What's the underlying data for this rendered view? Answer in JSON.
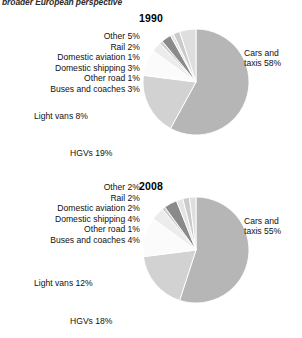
{
  "page": {
    "header": "broader European perspective"
  },
  "chart_data": [
    {
      "type": "pie",
      "title": "1990",
      "categories": [
        "Cars and taxis",
        "HGVs",
        "Light vans",
        "Buses and coaches",
        "Other road",
        "Domestic shipping",
        "Domestic aviation",
        "Rail",
        "Other"
      ],
      "values": [
        58,
        19,
        8,
        3,
        1,
        3,
        1,
        2,
        5
      ],
      "unit": "%",
      "labels": [
        "Cars and taxis 58%",
        "HGVs 19%",
        "Light vans 8%",
        "Buses and  coaches 3%",
        "Other road 1%",
        "Domestic shipping 3%",
        "Domestic aviation 1%",
        "Rail 2%",
        "Other 5%"
      ],
      "slice_colors": [
        "#b6b6b6",
        "#d2d2d2",
        "#fbfbfb",
        "#ececec",
        "#cfcfcf",
        "#8a8a8a",
        "#e4e4e4",
        "#cacaca",
        "#dedede"
      ],
      "start_angle": 0,
      "direction": "clockwise",
      "xlabel": "",
      "ylabel": "",
      "legend": "none",
      "grid": false
    },
    {
      "type": "pie",
      "title": "2008",
      "categories": [
        "Cars and taxis",
        "HGVs",
        "Light vans",
        "Buses and coaches",
        "Other road",
        "Domestic shipping",
        "Domestic aviation",
        "Rail",
        "Other"
      ],
      "values": [
        55,
        18,
        12,
        4,
        1,
        4,
        2,
        2,
        2
      ],
      "unit": "%",
      "labels": [
        "Cars and taxis 55%",
        "HGVs 18%",
        "Light vans 12%",
        "Buses and coaches 4%",
        "Other road 1%",
        "Domestic shipping 4%",
        "Domestic aviation 2%",
        "Rail 2%",
        "Other 2%"
      ],
      "slice_colors": [
        "#b6b6b6",
        "#d2d2d2",
        "#fbfbfb",
        "#ececec",
        "#cfcfcf",
        "#8a8a8a",
        "#e4e4e4",
        "#cacaca",
        "#dedede"
      ],
      "start_angle": 0,
      "direction": "clockwise",
      "xlabel": "",
      "ylabel": "",
      "legend": "none",
      "grid": false
    }
  ]
}
